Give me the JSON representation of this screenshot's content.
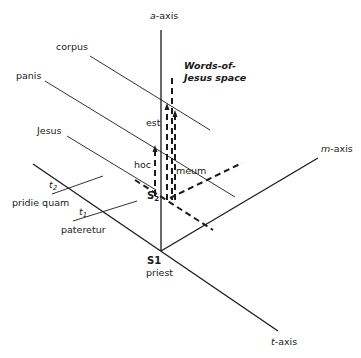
{
  "diagram": {
    "axes": {
      "a_axis": {
        "var": "a",
        "suffix": "-axis"
      },
      "m_axis": {
        "var": "m",
        "suffix": "-axis"
      },
      "t_axis": {
        "var": "t",
        "suffix": "-axis"
      }
    },
    "space_title": {
      "line1": "Words-of-",
      "line2": "Jesus space"
    },
    "lines": {
      "corpus": "corpus",
      "panis": "panis",
      "jesus": "Jesus"
    },
    "words": {
      "est": "est",
      "hoc": "hoc",
      "meum": "meum"
    },
    "points": {
      "s2": {
        "letter": "S",
        "sub": "2"
      },
      "s1": {
        "label": "S1",
        "caption": "priest"
      }
    },
    "times": {
      "t2": {
        "letter": "t",
        "sub": "2",
        "caption": "pridie quam"
      },
      "t1": {
        "letter": "t",
        "sub": "1",
        "caption": "pateretur"
      }
    }
  }
}
